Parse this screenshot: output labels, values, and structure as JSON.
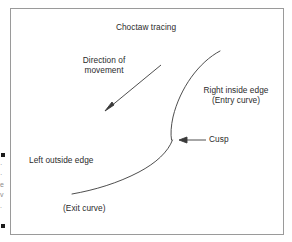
{
  "figure": {
    "title": "Choctaw tracing",
    "border_color": "#9a9a9a",
    "background_color": "#ffffff",
    "ink_color": "#2b2b2b",
    "labels": {
      "direction": "Direction of\nmovement",
      "right_edge": "Right inside edge\n(Entry curve)",
      "cusp": "Cusp",
      "left_edge": "Left outside edge",
      "exit": "(Exit curve)"
    },
    "annotations": {
      "direction_arrow": "arrow pointing down-left along direction of movement",
      "cusp_arrow": "arrow pointing left from Cusp label to curve cusp"
    },
    "margin_bleed": {
      "fragment_1": "·",
      "fragment_2": "·",
      "fragment_3": "e",
      "fragment_4": "v",
      "fragment_5": "."
    }
  }
}
